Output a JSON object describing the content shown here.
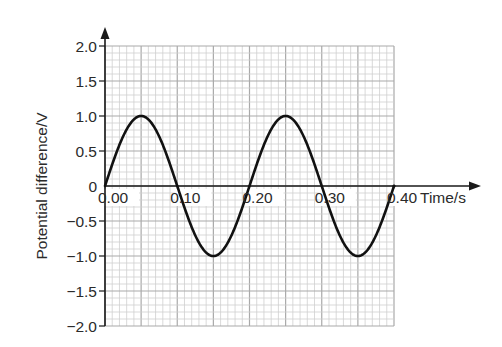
{
  "chart_data": {
    "type": "line",
    "title": "",
    "xlabel": "Time/s",
    "ylabel": "Potential difference/V",
    "xlim": [
      0,
      0.4
    ],
    "ylim": [
      -2.0,
      2.0
    ],
    "grid": true,
    "grid_minor": {
      "x": 0.01,
      "y": 0.1
    },
    "grid_major": {
      "x": 0.05,
      "y": 0.5
    },
    "x_ticks": [
      "0.00",
      "0.10",
      "0.20",
      "0.30",
      "0.40"
    ],
    "y_ticks": [
      "2.0",
      "1.5",
      "1.0",
      "0.5",
      "0",
      "-0.5",
      "-1.0",
      "-1.5",
      "-2.0"
    ],
    "series": [
      {
        "name": "Potential difference",
        "function": "sine",
        "amplitude": 1.0,
        "period": 0.2,
        "x": [
          0.0,
          0.05,
          0.1,
          0.15,
          0.2,
          0.25,
          0.3,
          0.35,
          0.4
        ],
        "y": [
          0.0,
          1.0,
          0.0,
          -1.0,
          0.0,
          1.0,
          0.0,
          -1.0,
          0.0
        ]
      }
    ],
    "colors": {
      "grid_minor": "#cfcfcf",
      "grid_major": "#a9a9a9",
      "curve": "#111111",
      "axis": "#1a1a1a",
      "text": "#2b2b2b"
    }
  },
  "axes": {
    "x_title": "Time/s",
    "y_title": "Potential difference/V",
    "x_labels": [
      "0.00",
      "0.10",
      "0.20",
      "0.30",
      "0.40"
    ],
    "y_labels": [
      "2.0",
      "1.5",
      "1.0",
      "0.5",
      "0",
      "−0.5",
      "−1.0",
      "−1.5",
      "−2.0"
    ]
  }
}
